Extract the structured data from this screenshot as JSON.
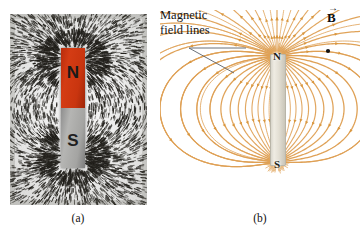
{
  "figure": {
    "panels": [
      {
        "id": "a",
        "caption": "(a)",
        "kind": "photograph",
        "description": "iron filings around a bar magnet",
        "magnet": {
          "north_label": "N",
          "south_label": "S",
          "north_color": "#c9350f",
          "south_color": "#a4a4a2"
        }
      },
      {
        "id": "b",
        "caption": "(b)",
        "kind": "diagram",
        "description": "magnetic field lines of a bar magnet",
        "magnet": {
          "north_label": "N",
          "south_label": "S",
          "body_color": "#e3dfd4"
        },
        "field_line_color": "#dfa156",
        "leader_color": "#5a6169"
      }
    ],
    "annotations": {
      "field_lines_label_line1": "Magnetic",
      "field_lines_label_line2": "field lines",
      "b_vector_symbol": "B",
      "b_vector_arrow": "→"
    }
  },
  "chart_data": {
    "type": "diagram",
    "panels": [
      "(a)",
      "(b)"
    ],
    "annotations": [
      "Magnetic field lines",
      "B"
    ],
    "poles": [
      "N",
      "S"
    ],
    "field_line_count": 40,
    "dipole_center": [
      117,
      99
    ],
    "pole_positions": {
      "N": [
        117,
        46
      ],
      "S": [
        117,
        152
      ]
    },
    "field_point_marker": [
      168,
      41
    ],
    "colors": {
      "field_lines": "#dfa156",
      "magnet_north": "#c9350f",
      "magnet_south": "#a4a4a2",
      "leader": "#5a6169"
    }
  }
}
